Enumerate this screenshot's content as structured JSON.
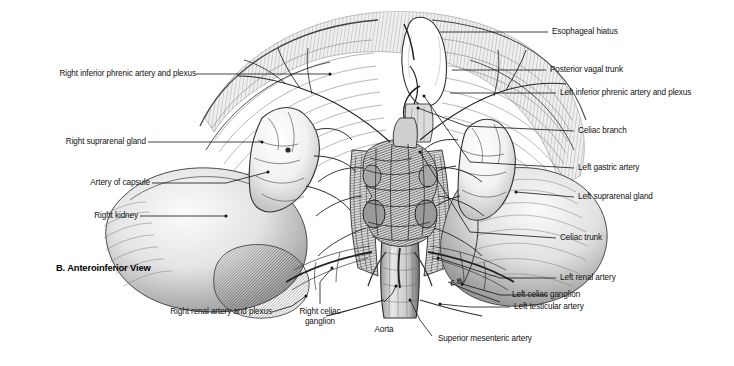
{
  "figure": {
    "caption": "B. Anteroinferior View",
    "artist_signature": "E.B.",
    "ink_color": "#1a1a1a",
    "background_color": "#ffffff",
    "leader_color": "#111111"
  },
  "labels_left": [
    {
      "id": "right-inferior-phrenic-artery-and-plexus",
      "text": "Right inferior phrenic artery and plexus"
    },
    {
      "id": "right-suprarenal-gland",
      "text": "Right suprarenal gland"
    },
    {
      "id": "artery-of-capsule",
      "text": "Artery of capsule"
    },
    {
      "id": "right-kidney",
      "text": "Right kidney"
    }
  ],
  "labels_right": [
    {
      "id": "esophageal-hiatus",
      "text": "Esophageal hiatus"
    },
    {
      "id": "posterior-vagal-trunk",
      "text": "Posterior vagal trunk"
    },
    {
      "id": "left-inferior-phrenic-artery-and-plexus",
      "text": "Left inferior phrenic artery and plexus"
    },
    {
      "id": "celiac-branch",
      "text": "Celiac branch"
    },
    {
      "id": "left-gastric-artery",
      "text": "Left gastric artery"
    },
    {
      "id": "left-suprarenal-gland",
      "text": "Left suprarenal gland"
    },
    {
      "id": "celiac-trunk",
      "text": "Celiac trunk"
    },
    {
      "id": "left-renal-artery",
      "text": "Left renal artery"
    },
    {
      "id": "left-testicular-artery",
      "text": "Left testicular artery"
    }
  ],
  "labels_bottom": [
    {
      "id": "right-renal-artery-and-plexus",
      "text": "Right renal artery and plexus"
    },
    {
      "id": "right-celiac-ganglion",
      "text": "Right celiac\nganglion",
      "line1": "Right celiac",
      "line2": "ganglion"
    },
    {
      "id": "aorta",
      "text": "Aorta"
    },
    {
      "id": "left-celiac-ganglion",
      "text": "Left celiac ganglion"
    },
    {
      "id": "superior-mesenteric-artery",
      "text": "Superior mesenteric artery"
    }
  ]
}
